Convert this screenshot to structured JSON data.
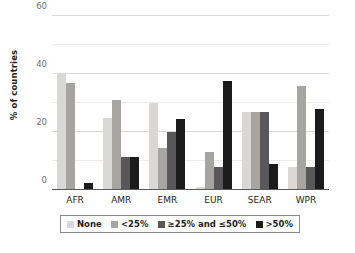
{
  "chart_data": {
    "type": "bar",
    "title": "",
    "subtitle": "",
    "xlabel": "",
    "ylabel": "% of countries",
    "ylim": [
      0,
      60
    ],
    "yticks": [
      0,
      20,
      40,
      60
    ],
    "ytick_labels": [
      "0",
      "20",
      "40",
      "60"
    ],
    "gridlines": [
      10,
      20,
      30,
      40,
      50,
      60
    ],
    "grid": true,
    "legend_position": "bottom",
    "categories": [
      "AFR",
      "AMR",
      "EMR",
      "EUR",
      "SEAR",
      "WPR"
    ],
    "series": [
      {
        "name": "None",
        "color": "#d9d8d6",
        "values": [
          40,
          25,
          30,
          1,
          27,
          8
        ]
      },
      {
        "name": "<25%",
        "color": "#a6a5a2",
        "values": [
          37,
          31,
          14.5,
          13,
          27,
          36
        ]
      },
      {
        "name": "≥25% and ≤50%",
        "color": "#58575a",
        "values": [
          0,
          11.5,
          20,
          8,
          27,
          8
        ]
      },
      {
        "name": ">50%",
        "color": "#1b1b1b",
        "values": [
          2.5,
          11.5,
          24.5,
          37.5,
          9,
          28
        ]
      }
    ]
  }
}
